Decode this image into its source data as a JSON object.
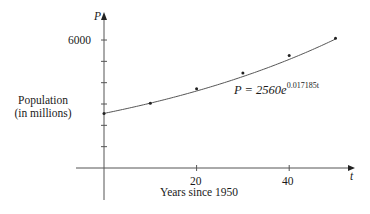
{
  "chart_data": {
    "type": "scatter",
    "title": "",
    "xlabel": "Years since 1950",
    "ylabel": "Population (in millions)",
    "x_axis_symbol": "t",
    "y_axis_symbol": "P",
    "x_ticks": [
      0,
      10,
      20,
      30,
      40,
      50
    ],
    "x_tick_labels": [
      "20",
      "40"
    ],
    "y_ticks": [
      1000,
      2000,
      3000,
      4000,
      5000,
      6000
    ],
    "y_tick_labels": [
      "6000"
    ],
    "xlim": [
      0,
      53
    ],
    "ylim": [
      0,
      7300
    ],
    "grid": false,
    "legend": null,
    "series": [
      {
        "name": "Observed population",
        "type": "scatter",
        "x": [
          0,
          10,
          20,
          30,
          40,
          50
        ],
        "y": [
          2560,
          3040,
          3710,
          4450,
          5280,
          6080
        ]
      },
      {
        "name": "Exponential model",
        "type": "line",
        "equation": "P = 2560e^(0.017185t)",
        "a": 2560,
        "k": 0.017185,
        "x_range": [
          0,
          50
        ]
      }
    ],
    "annotations": [
      {
        "text": "P = 2560e^{0.017185t}",
        "x": 28,
        "y": 3500
      }
    ]
  },
  "labels": {
    "y_axis_symbol": "P",
    "x_axis_symbol": "t",
    "y_tick_6000": "6000",
    "x_tick_20": "20",
    "x_tick_40": "40",
    "xlabel": "Years since 1950",
    "ylabel_line1": "Population",
    "ylabel_line2": "(in millions)",
    "formula_base": "P = 2560e",
    "formula_exp": "0.017185t"
  }
}
